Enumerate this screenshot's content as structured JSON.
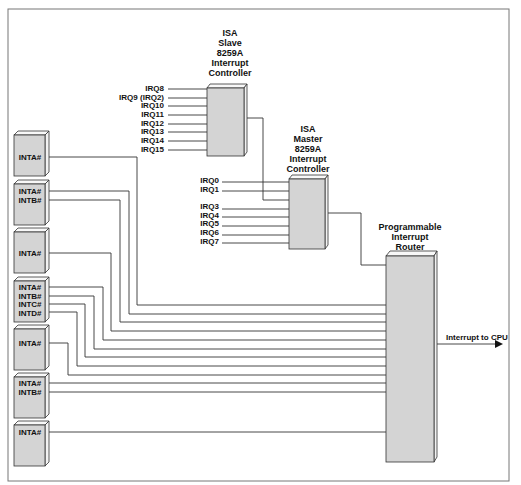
{
  "diagram": {
    "slave_controller": {
      "lines": [
        "ISA",
        "Slave",
        "8259A",
        "Interrupt",
        "Controller"
      ],
      "inputs": [
        "IRQ8",
        "IRQ9 (IRQ2)",
        "IRQ10",
        "IRQ11",
        "IRQ12",
        "IRQ13",
        "IRQ14",
        "IRQ15"
      ]
    },
    "master_controller": {
      "lines": [
        "ISA",
        "Master",
        "8259A",
        "Interrupt",
        "Controller"
      ],
      "inputs": [
        "IRQ0",
        "IRQ1",
        "IRQ3",
        "IRQ4",
        "IRQ5",
        "IRQ6",
        "IRQ7"
      ]
    },
    "router": {
      "lines": [
        "Programmable",
        "Interrupt",
        "Router"
      ],
      "output_label": "Interrupt to CPU"
    },
    "slots": [
      {
        "pins": [
          "INTA#"
        ]
      },
      {
        "pins": [
          "INTA#",
          "INTB#"
        ]
      },
      {
        "pins": [
          "INTA#"
        ]
      },
      {
        "pins": [
          "INTA#",
          "INTB#",
          "INTC#",
          "INTD#"
        ]
      },
      {
        "pins": [
          "INTA#"
        ]
      },
      {
        "pins": [
          "INTA#",
          "INTB#"
        ]
      },
      {
        "pins": [
          "INTA#"
        ]
      }
    ],
    "colors": {
      "box_fill": "#d4d4d4",
      "wire": "#333333",
      "border": "#777777"
    }
  }
}
